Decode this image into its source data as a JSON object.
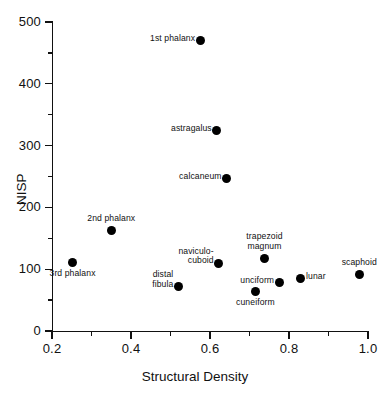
{
  "chart_data": {
    "type": "scatter",
    "title": "",
    "xlabel": "Structural Density",
    "ylabel": "NISP",
    "xlim": [
      0.2,
      1.0
    ],
    "ylim": [
      0,
      500
    ],
    "grid": false,
    "legend": null,
    "x_ticks_major": [
      "0.2",
      "0.4",
      "0.6",
      "0.8",
      "1.0"
    ],
    "x_ticks_major_values": [
      0.2,
      0.4,
      0.6,
      0.8,
      1.0
    ],
    "x_ticks_minor_values": [
      0.3,
      0.5,
      0.7,
      0.9
    ],
    "y_ticks_major": [
      "0",
      "100",
      "200",
      "300",
      "400",
      "500"
    ],
    "y_ticks_major_values": [
      0,
      100,
      200,
      300,
      400,
      500
    ],
    "y_ticks_minor_values": [
      50,
      150,
      250,
      350,
      450
    ],
    "points": [
      {
        "label": "1st phalanx",
        "x": 0.575,
        "y": 470,
        "label_pos": "left"
      },
      {
        "label": "astragalus",
        "x": 0.617,
        "y": 325,
        "label_pos": "left"
      },
      {
        "label": "calcaneum",
        "x": 0.642,
        "y": 246,
        "label_pos": "left"
      },
      {
        "label": "2nd phalanx",
        "x": 0.35,
        "y": 163,
        "label_pos": "above"
      },
      {
        "label": "3rd phalanx",
        "x": 0.252,
        "y": 111,
        "label_pos": "below"
      },
      {
        "label": "naviculo-\ncuboid",
        "x": 0.622,
        "y": 110,
        "label_pos": "left"
      },
      {
        "label": "trapezoid\nmagnum",
        "x": 0.738,
        "y": 117,
        "label_pos": "above"
      },
      {
        "label": "distal\nfibula",
        "x": 0.52,
        "y": 72,
        "label_pos": "left"
      },
      {
        "label": "unciform",
        "x": 0.775,
        "y": 78,
        "label_pos": "left"
      },
      {
        "label": "lunar",
        "x": 0.828,
        "y": 85,
        "label_pos": "right"
      },
      {
        "label": "cuneiform",
        "x": 0.715,
        "y": 64,
        "label_pos": "below"
      },
      {
        "label": "scaphoid",
        "x": 0.978,
        "y": 92,
        "label_pos": "above"
      }
    ],
    "marker": {
      "shape": "circle",
      "color": "#000000",
      "size_px": 9
    },
    "axis_color": "#111111"
  }
}
